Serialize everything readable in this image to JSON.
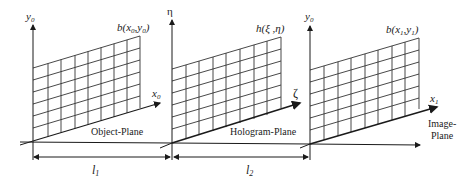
{
  "planes": [
    {
      "id": "object",
      "label": "Object-Plane",
      "vertical_axis": "y",
      "vertical_axis_sub": "0",
      "horizontal_axis": "x",
      "horizontal_axis_sub": "0",
      "function_label": "b(x",
      "function_sub1": "0",
      "function_mid": ",y",
      "function_sub2": "0",
      "function_end": ")"
    },
    {
      "id": "hologram",
      "label": "Hologram-Plane",
      "vertical_axis": "η",
      "horizontal_axis": "ζ",
      "function_label": "h(ξ ,η)"
    },
    {
      "id": "image",
      "label_line1": "Image-",
      "label_line2": "Plane",
      "vertical_axis": "y",
      "vertical_axis_sub": "0",
      "horizontal_axis": "x",
      "horizontal_axis_sub": "1",
      "function_label": "b(x",
      "function_sub1": "1",
      "function_mid": ",y",
      "function_sub2": "1",
      "function_end": ")"
    }
  ],
  "distances": [
    {
      "label": "l",
      "sub": "1"
    },
    {
      "label": "l",
      "sub": "2"
    }
  ],
  "colors": {
    "line": "#1a1a1a",
    "grid": "#333333",
    "background": "#ffffff"
  }
}
